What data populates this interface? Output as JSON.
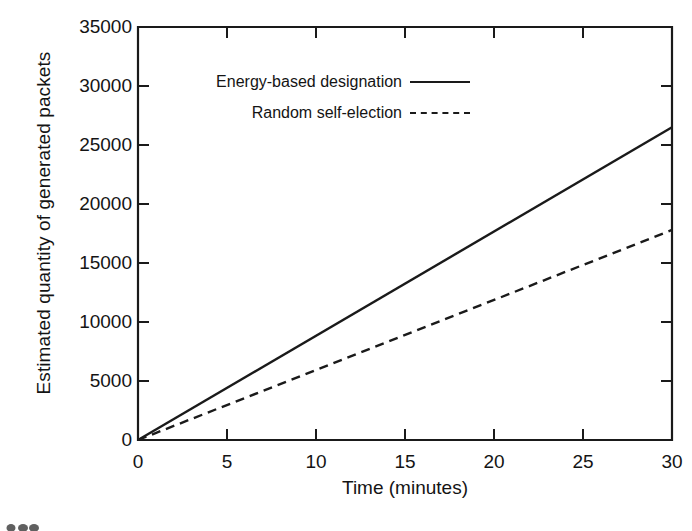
{
  "figure": {
    "background_color": "#ffffff",
    "ink_color": "#1a1a1a"
  },
  "chart_data": {
    "type": "line",
    "title": "",
    "xlabel": "Time (minutes)",
    "ylabel": "Estimated quantity of generated packets",
    "xlim": [
      0,
      30
    ],
    "ylim": [
      0,
      35000
    ],
    "xticks": [
      0,
      5,
      10,
      15,
      20,
      25,
      30
    ],
    "xtick_labels": [
      "0",
      "5",
      "10",
      "15",
      "20",
      "25",
      "30"
    ],
    "yticks": [
      0,
      5000,
      10000,
      15000,
      20000,
      25000,
      30000,
      35000
    ],
    "ytick_labels": [
      "0",
      "5000",
      "10000",
      "15000",
      "20000",
      "25000",
      "30000",
      "35000"
    ],
    "grid": false,
    "legend_position": "upper-center-inside",
    "x": [
      0,
      30
    ],
    "series": [
      {
        "name": "Energy-based designation",
        "style": "solid",
        "color": "#1a1a1a",
        "values": [
          0,
          26500
        ]
      },
      {
        "name": "Random self-election",
        "style": "dashed",
        "color": "#1a1a1a",
        "values": [
          0,
          17800
        ]
      }
    ]
  },
  "legend": {
    "entries": [
      {
        "label": "Energy-based designation",
        "style": "solid"
      },
      {
        "label": "Random self-election",
        "style": "dashed"
      }
    ]
  }
}
